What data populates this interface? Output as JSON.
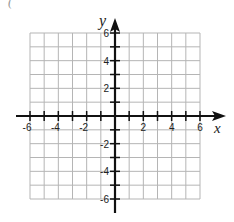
{
  "header_fragment": "(",
  "chart_data": {
    "type": "scatter",
    "title": "",
    "xlabel": "x",
    "ylabel": "y",
    "xlim": [
      -6,
      6
    ],
    "ylim": [
      -6,
      6
    ],
    "grid": true,
    "grid_step": 1,
    "x_ticks": [
      -6,
      -4,
      -2,
      2,
      4,
      6
    ],
    "y_ticks": [
      -6,
      -4,
      -2,
      2,
      4,
      6
    ],
    "x_tick_labels": [
      "-6",
      "-4",
      "-2",
      "2",
      "4",
      "6"
    ],
    "y_tick_labels": [
      "-6",
      "-4",
      "-2",
      "2",
      "4",
      "6"
    ],
    "series": [],
    "arrows": {
      "x_positive": true,
      "y_positive": true
    }
  },
  "colors": {
    "grid": "#b5b5b5",
    "axis": "#111111",
    "label": "#222222"
  }
}
